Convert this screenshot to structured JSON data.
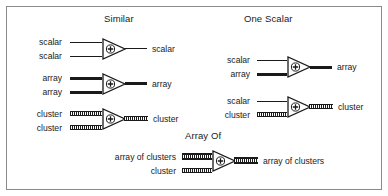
{
  "figure": {
    "background_color": "#ffffff",
    "border_color": "#8a8a8a",
    "ink_color": "#1a1a1a"
  },
  "sections": [
    {
      "id": "similar",
      "heading": "Similar"
    },
    {
      "id": "one_scalar",
      "heading": "One Scalar"
    },
    {
      "id": "array_of",
      "heading": "Array Of"
    }
  ],
  "operator": {
    "symbol": "+",
    "name": "add-function-node"
  },
  "rows": [
    {
      "id": "similar-scalar",
      "section": "similar",
      "inputs": [
        {
          "label": "scalar",
          "wire": "scalar"
        },
        {
          "label": "scalar",
          "wire": "scalar"
        }
      ],
      "output": {
        "label": "scalar",
        "wire": "scalar"
      }
    },
    {
      "id": "similar-array",
      "section": "similar",
      "inputs": [
        {
          "label": "array",
          "wire": "array"
        },
        {
          "label": "array",
          "wire": "array"
        }
      ],
      "output": {
        "label": "array",
        "wire": "array"
      }
    },
    {
      "id": "similar-cluster",
      "section": "similar",
      "inputs": [
        {
          "label": "cluster",
          "wire": "cluster"
        },
        {
          "label": "cluster",
          "wire": "cluster"
        }
      ],
      "output": {
        "label": "cluster",
        "wire": "cluster"
      }
    },
    {
      "id": "one-scalar-array",
      "section": "one_scalar",
      "inputs": [
        {
          "label": "scalar",
          "wire": "scalar"
        },
        {
          "label": "array",
          "wire": "array"
        }
      ],
      "output": {
        "label": "array",
        "wire": "array"
      }
    },
    {
      "id": "one-scalar-cluster",
      "section": "one_scalar",
      "inputs": [
        {
          "label": "scalar",
          "wire": "scalar"
        },
        {
          "label": "cluster",
          "wire": "cluster"
        }
      ],
      "output": {
        "label": "cluster",
        "wire": "cluster"
      }
    },
    {
      "id": "array-of-clusters",
      "section": "array_of",
      "inputs": [
        {
          "label": "array of clusters",
          "wire": "arrcluster"
        },
        {
          "label": "cluster",
          "wire": "cluster"
        }
      ],
      "output": {
        "label": "array of clusters",
        "wire": "arrcluster"
      }
    }
  ]
}
